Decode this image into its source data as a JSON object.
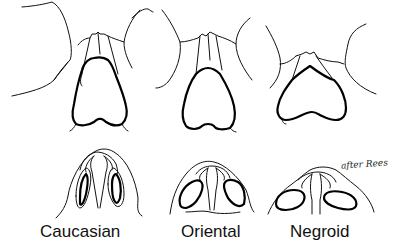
{
  "figure": {
    "panels": [
      {
        "label": "Caucasian"
      },
      {
        "label": "Oriental"
      },
      {
        "label": "Negroid"
      }
    ],
    "credit": "after Rees",
    "colors": {
      "line": "#000000",
      "background": "#ffffff"
    }
  }
}
